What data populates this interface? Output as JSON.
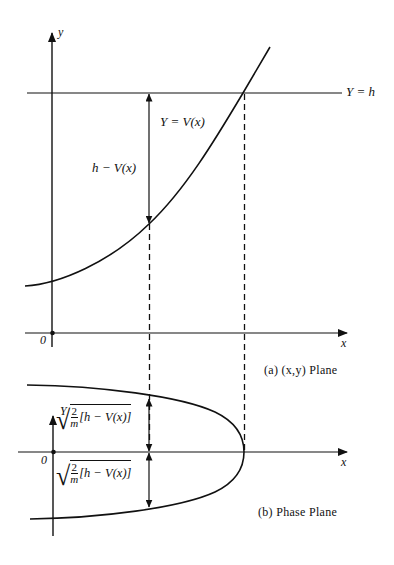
{
  "figure": {
    "panel_a": {
      "y_axis_label": "y",
      "x_axis_label": "x",
      "origin_label": "0",
      "line_label": "Y = h",
      "curve_label": "Y = V(x)",
      "gap_label": "h − V(x)",
      "caption": "(a)  (x,y)  Plane"
    },
    "panel_b": {
      "y_axis_label": "Y",
      "x_axis_label": "x",
      "origin_label": "0",
      "upper_label_fraction_num": "2",
      "upper_label_fraction_den": "m",
      "upper_label_bracket": "[h − V(x)]",
      "lower_label_fraction_num": "2",
      "lower_label_fraction_den": "m",
      "lower_label_bracket": "[h − V(x)]",
      "caption": "(b)  Phase  Plane"
    },
    "colors": {
      "stroke": "#111111",
      "background": "#ffffff"
    }
  }
}
